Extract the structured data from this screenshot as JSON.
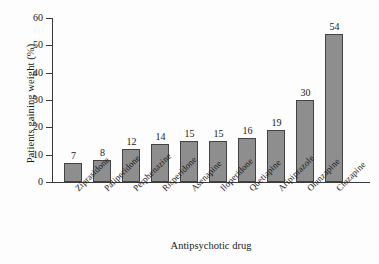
{
  "chart_data": {
    "type": "bar",
    "title": "",
    "xlabel": "Antipsychotic drug",
    "ylabel": "Patients gaining weight (%)",
    "categories": [
      "Ziprasidone",
      "Paliperidone",
      "Perphenazine",
      "Risperidone",
      "Asenapine",
      "Iloperidone",
      "Quetiapine",
      "Aripiprazole",
      "Olanzapine",
      "Clozapine"
    ],
    "values": [
      7,
      8,
      12,
      14,
      15,
      15,
      16,
      19,
      30,
      54
    ],
    "ylim": [
      0,
      60
    ],
    "yticks": [
      0,
      10,
      20,
      30,
      40,
      50,
      60
    ],
    "ytick_labels": [
      "0",
      "10",
      "20",
      "30",
      "40",
      "50",
      "60"
    ],
    "grid": false,
    "legend": "none",
    "bar_color": "#8e8e8e",
    "bar_edge_color": "#434343",
    "axis_color": "#3a3a3a",
    "background_color": "#fdfdfd",
    "value_labels": [
      "7",
      "8",
      "12",
      "14",
      "15",
      "15",
      "16",
      "19",
      "30",
      "54"
    ],
    "xtick_label_rotation": -45
  }
}
